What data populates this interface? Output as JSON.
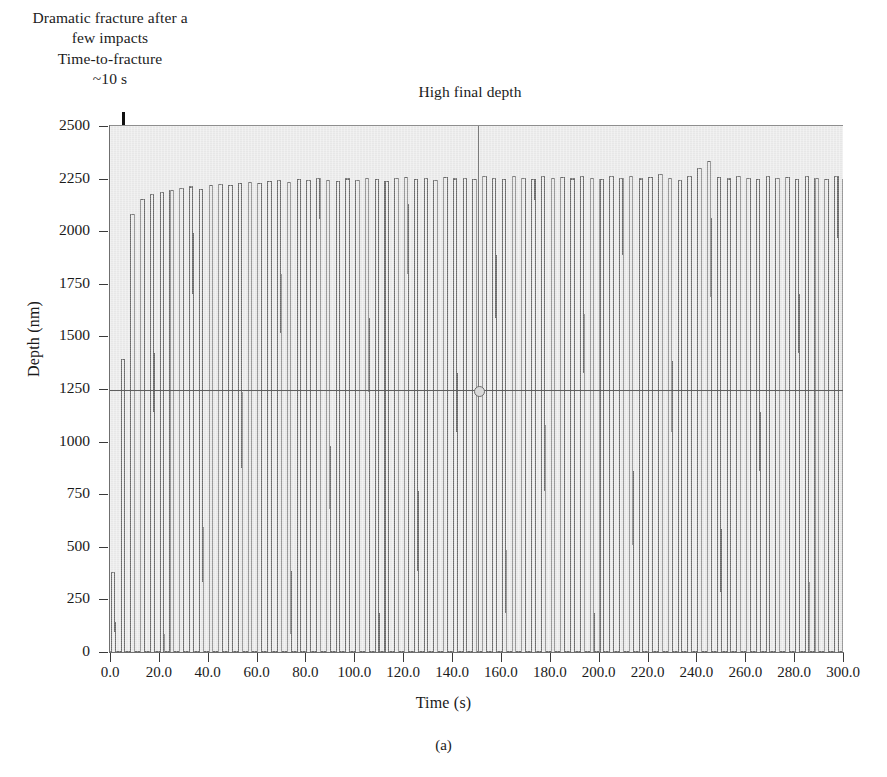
{
  "figure": {
    "subcaption": "(a)",
    "annotations": [
      {
        "id": "fracture",
        "text": "Dramatic fracture after a\nfew impacts\nTime-to-fracture\n~10 s"
      },
      {
        "id": "final_depth",
        "text": "High final depth"
      }
    ]
  },
  "chart_data": {
    "type": "line",
    "title": "",
    "subtitle": "",
    "xlabel": "Time (s)",
    "ylabel": "Depth (nm)",
    "xlim": [
      0.0,
      300.0
    ],
    "ylim": [
      0,
      2500
    ],
    "xticks": [
      "0.0",
      "20.0",
      "40.0",
      "60.0",
      "80.0",
      "100.0",
      "120.0",
      "140.0",
      "160.0",
      "180.0",
      "200.0",
      "220.0",
      "240.0",
      "260.0",
      "280.0",
      "300.0"
    ],
    "yticks": [
      "0",
      "250",
      "500",
      "750",
      "1000",
      "1250",
      "1500",
      "1750",
      "2000",
      "2250",
      "2500"
    ],
    "grid": false,
    "legend": null,
    "legend_position": "none",
    "series": [
      {
        "name": "Impact depth trace",
        "description": "Repetitive impact depth-versus-time trace; each impact cycle shows a rapid excursion to a peak depth followed by return toward the baseline. Peak depths (nm) sampled per impact cycle from t=0 to t=300 s.",
        "impact_period_s": 4.0,
        "baseline_nm": 0,
        "peaks_nm": [
          380,
          1390,
          2080,
          2150,
          2175,
          2185,
          2195,
          2205,
          2210,
          2200,
          2215,
          2220,
          2215,
          2225,
          2230,
          2225,
          2235,
          2240,
          2230,
          2245,
          2240,
          2250,
          2240,
          2235,
          2248,
          2242,
          2252,
          2245,
          2238,
          2250,
          2255,
          2245,
          2250,
          2242,
          2256,
          2248,
          2252,
          2244,
          2258,
          2250,
          2246,
          2258,
          2252,
          2244,
          2260,
          2250,
          2255,
          2248,
          2262,
          2252,
          2245,
          2258,
          2250,
          2262,
          2248,
          2255,
          2268,
          2250,
          2243,
          2258,
          2300,
          2330,
          2255,
          2248,
          2262,
          2252,
          2244,
          2258,
          2250,
          2256,
          2246,
          2260,
          2252,
          2244,
          2258,
          2248,
          2262,
          2340,
          2250,
          2244
        ]
      }
    ],
    "markers": [
      {
        "name": "cursor-crosshair",
        "x": 150.0,
        "y": 1250,
        "style": "crosshair-with-circle"
      }
    ],
    "annotations": [
      {
        "text": "Dramatic fracture after a few impacts Time-to-fracture ~10 s",
        "points_to_x": 2.0,
        "points_to_y": 1500,
        "arrow": "down"
      },
      {
        "text": "High final depth",
        "at_x": 150.0,
        "at_y": 2500
      }
    ]
  }
}
